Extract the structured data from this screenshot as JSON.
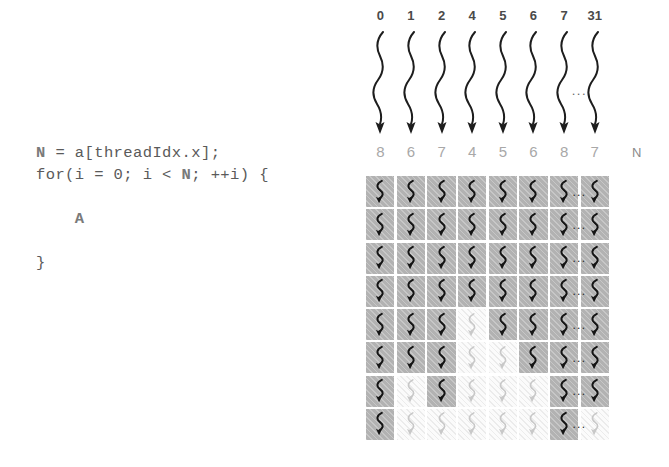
{
  "code": {
    "lines": [
      {
        "segments": [
          {
            "text": "N",
            "bold": true
          },
          {
            "text": " = a[threadIdx.x];",
            "bold": false
          }
        ]
      },
      {
        "segments": [
          {
            "text": "for(i = 0; i < ",
            "bold": false
          },
          {
            "text": "N",
            "bold": true
          },
          {
            "text": "; ++i) {",
            "bold": false
          }
        ]
      },
      {
        "segments": [
          {
            "text": "",
            "bold": false
          }
        ]
      },
      {
        "segments": [
          {
            "text": "    ",
            "bold": false
          },
          {
            "text": "A",
            "bold": true
          }
        ]
      },
      {
        "segments": [
          {
            "text": "",
            "bold": false
          }
        ]
      },
      {
        "segments": [
          {
            "text": "}",
            "bold": false
          }
        ]
      }
    ]
  },
  "diagram": {
    "thread_ids": [
      "0",
      "1",
      "2",
      "4",
      "5",
      "6",
      "7",
      "31"
    ],
    "n_values": [
      8,
      6,
      7,
      4,
      5,
      6,
      8,
      7
    ],
    "n_label": "N",
    "header_ellipsis": "...",
    "grid_ellipsis": "...",
    "rows": 8,
    "columns": 8,
    "ellipsis_after_column_index": 6,
    "arrow_icon": "wavy-down-arrow-icon",
    "cell_icon": "wavy-execution-trace-icon",
    "colors": {
      "active_cell": "#b2b2b2",
      "inactive_cell": "#fbfbfb",
      "active_squiggle": "#141414",
      "inactive_squiggle": "#c8c8c8",
      "code_text": "#5a5a5a",
      "code_bold": "#7a7a7a",
      "thread_id_text": "#4a4a4a",
      "n_value_text": "#a8a8a8"
    },
    "activity": [
      [
        true,
        true,
        true,
        true,
        true,
        true,
        true,
        true
      ],
      [
        true,
        true,
        true,
        true,
        true,
        true,
        true,
        true
      ],
      [
        true,
        true,
        true,
        true,
        true,
        true,
        true,
        true
      ],
      [
        true,
        true,
        true,
        true,
        true,
        true,
        true,
        true
      ],
      [
        true,
        true,
        true,
        false,
        true,
        true,
        true,
        true
      ],
      [
        true,
        true,
        true,
        false,
        false,
        true,
        true,
        true
      ],
      [
        true,
        false,
        true,
        false,
        false,
        false,
        true,
        true
      ],
      [
        true,
        false,
        false,
        false,
        false,
        false,
        true,
        false
      ]
    ]
  }
}
